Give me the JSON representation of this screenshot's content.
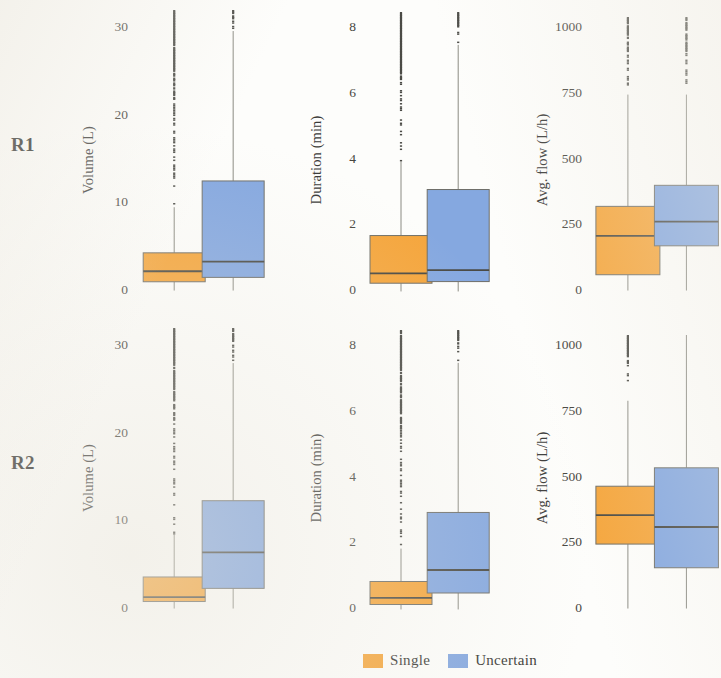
{
  "figure": {
    "width": 721,
    "height": 678,
    "row_labels": [
      "R1",
      "R2"
    ],
    "background": "#fdfdfb"
  },
  "legend": {
    "position": "bottom-center",
    "items": [
      {
        "label": "Single",
        "color": "#f5a63d"
      },
      {
        "label": "Uncertain",
        "color": "#85a8e0"
      }
    ]
  },
  "colors": {
    "single": "#f5a63d",
    "uncertain": "#85a8e0",
    "box_edge": "#6e6e68",
    "whisker": "#8a8a82",
    "outlier": "#4b4b46",
    "median": "#4a4a44",
    "text": "#3a3a38"
  },
  "chart_data": {
    "type": "box",
    "title": "",
    "groups": [
      "Single",
      "Uncertain"
    ],
    "rows": [
      "R1",
      "R2"
    ],
    "panels": [
      {
        "row": "R1",
        "column": 0,
        "ylabel": "Volume (L)",
        "ylim": [
          0,
          32
        ],
        "yticks": [
          0,
          10,
          20,
          30
        ],
        "ytick_labels": [
          "0",
          "10",
          "20",
          "30"
        ],
        "boxes": [
          {
            "group": "Single",
            "color": "#f5a63d",
            "q1": 1.0,
            "median": 2.2,
            "q3": 4.3,
            "whisker_low": 0.0,
            "whisker_high": 9.5,
            "outlier_low": 9.8,
            "outlier_high": 32.0
          },
          {
            "group": "Uncertain",
            "color": "#85a8e0",
            "q1": 1.5,
            "median": 3.3,
            "q3": 12.5,
            "whisker_low": 0.0,
            "whisker_high": 29.6,
            "outlier_low": 29.8,
            "outlier_high": 32.0
          }
        ]
      },
      {
        "row": "R1",
        "column": 1,
        "ylabel": "Duration (min)",
        "ylim": [
          0,
          8.5
        ],
        "yticks": [
          0,
          2,
          4,
          6,
          8
        ],
        "ytick_labels": [
          "0",
          "2",
          "4",
          "6",
          "8"
        ],
        "boxes": [
          {
            "group": "Single",
            "color": "#f5a63d",
            "q1": 0.25,
            "median": 0.55,
            "q3": 1.7,
            "whisker_low": 0.0,
            "whisker_high": 3.95,
            "outlier_low": 4.0,
            "outlier_high": 8.5
          },
          {
            "group": "Uncertain",
            "color": "#85a8e0",
            "q1": 0.3,
            "median": 0.65,
            "q3": 3.1,
            "whisker_low": 0.0,
            "whisker_high": 7.5,
            "outlier_low": 7.55,
            "outlier_high": 8.5
          }
        ]
      },
      {
        "row": "R1",
        "column": 2,
        "ylabel": "Avg. flow (L/h)",
        "ylim": [
          0,
          1040
        ],
        "yticks": [
          0,
          250,
          500,
          750,
          1000
        ],
        "ytick_labels": [
          "0",
          "250",
          "500",
          "750",
          "1000"
        ],
        "boxes": [
          {
            "group": "Single",
            "color": "#f5a63d",
            "q1": 60,
            "median": 208,
            "q3": 320,
            "whisker_low": 0,
            "whisker_high": 745,
            "outlier_low": 760,
            "outlier_high": 1040
          },
          {
            "group": "Uncertain",
            "color": "#85a8e0",
            "q1": 170,
            "median": 262,
            "q3": 400,
            "whisker_low": 0,
            "whisker_high": 745,
            "outlier_low": 760,
            "outlier_high": 1040
          }
        ]
      },
      {
        "row": "R2",
        "column": 0,
        "ylabel": "Volume (L)",
        "ylim": [
          0,
          32
        ],
        "yticks": [
          0,
          10,
          20,
          30
        ],
        "ytick_labels": [
          "0",
          "10",
          "20",
          "30"
        ],
        "boxes": [
          {
            "group": "Single",
            "color": "#f5a63d",
            "q1": 0.8,
            "median": 1.3,
            "q3": 3.6,
            "whisker_low": 0.0,
            "whisker_high": 8.4,
            "outlier_low": 8.6,
            "outlier_high": 32.0
          },
          {
            "group": "Uncertain",
            "color": "#85a8e0",
            "q1": 2.3,
            "median": 6.4,
            "q3": 12.3,
            "whisker_low": 0.0,
            "whisker_high": 28.0,
            "outlier_low": 28.4,
            "outlier_high": 32.0
          }
        ]
      },
      {
        "row": "R2",
        "column": 1,
        "ylabel": "Duration (min)",
        "ylim": [
          0,
          8.5
        ],
        "yticks": [
          0,
          2,
          4,
          6,
          8
        ],
        "ytick_labels": [
          "0",
          "2",
          "4",
          "6",
          "8"
        ],
        "boxes": [
          {
            "group": "Single",
            "color": "#f5a63d",
            "q1": 0.15,
            "median": 0.35,
            "q3": 0.85,
            "whisker_low": 0.0,
            "whisker_high": 1.85,
            "outlier_low": 1.9,
            "outlier_high": 8.5
          },
          {
            "group": "Uncertain",
            "color": "#85a8e0",
            "q1": 0.5,
            "median": 1.2,
            "q3": 2.95,
            "whisker_low": 0.0,
            "whisker_high": 7.5,
            "outlier_low": 7.6,
            "outlier_high": 8.5
          }
        ]
      },
      {
        "row": "R2",
        "column": 2,
        "ylabel": "Avg. flow (L/h)",
        "ylim": [
          0,
          1040
        ],
        "yticks": [
          0,
          250,
          500,
          750,
          1000
        ],
        "ytick_labels": [
          "0",
          "250",
          "500",
          "750",
          "1000"
        ],
        "boxes": [
          {
            "group": "Single",
            "color": "#f5a63d",
            "q1": 245,
            "median": 355,
            "q3": 465,
            "whisker_low": 0,
            "whisker_high": 790,
            "outlier_low": 800,
            "outlier_high": 1040
          },
          {
            "group": "Uncertain",
            "color": "#85a8e0",
            "q1": 155,
            "median": 310,
            "q3": 535,
            "whisker_low": 0,
            "whisker_high": 1040,
            "outlier_low": null,
            "outlier_high": null
          }
        ]
      }
    ]
  }
}
